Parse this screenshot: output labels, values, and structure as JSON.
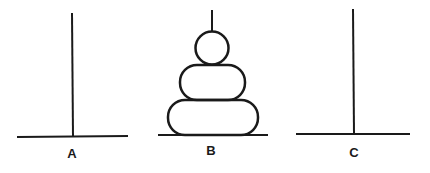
{
  "diagram": {
    "pegs": [
      {
        "id": "A",
        "label": "A",
        "disks": []
      },
      {
        "id": "B",
        "label": "B",
        "disks": [
          "large",
          "medium",
          "small"
        ]
      },
      {
        "id": "C",
        "label": "C",
        "disks": []
      }
    ],
    "disk_count": 3,
    "colors": {
      "line": "#1a1a1a",
      "background": "#ffffff"
    }
  }
}
